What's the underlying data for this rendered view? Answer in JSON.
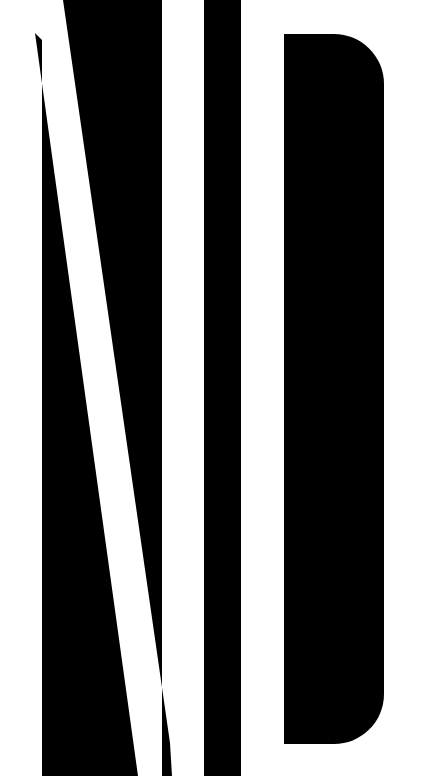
{
  "artwork": {
    "description": "Abstract black-and-white stylized letterforms (N/I/D)",
    "background_color": "#ffffff",
    "foreground_color": "#000000",
    "shapes": [
      {
        "name": "left-diagonal-block",
        "points": "42,0 63,0 170,743 160,776 42,776"
      },
      {
        "name": "left-right-block",
        "points": "63,0 162,0 162,776 138,776"
      },
      {
        "name": "vertical-bar",
        "x": 204,
        "y": 0,
        "width": 37,
        "height": 776
      },
      {
        "name": "d-shape",
        "x": 284,
        "y": 34,
        "width": 100,
        "height": 710,
        "radius": 50
      }
    ]
  }
}
